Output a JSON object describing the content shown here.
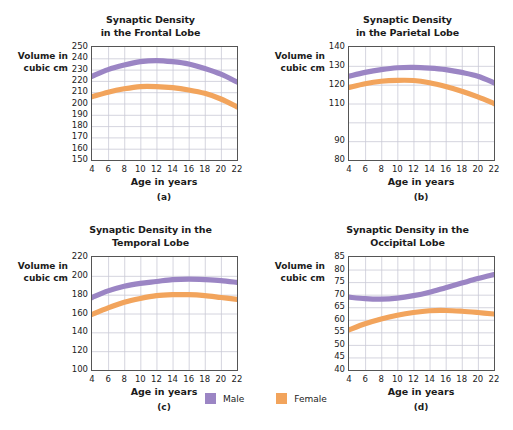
{
  "figure": {
    "caption_letters": [
      "(a)",
      "(b)",
      "(c)",
      "(d)"
    ],
    "shared_xlabel": "Age in years",
    "shared_ylabel": "Volume in\ncubic cm",
    "ylabel_line1": "Volume in",
    "ylabel_line2": "cubic cm"
  },
  "colors": {
    "male": "#9b85c4",
    "female": "#f2a45c",
    "grid": "#c9c9d6",
    "axis": "#555555",
    "text": "#1b1b1b"
  },
  "legend": {
    "position": "bottom-center",
    "items": [
      {
        "label": "Male",
        "color": "#9b85c4",
        "swatch_name": "male-swatch"
      },
      {
        "label": "Female",
        "color": "#f2a45c",
        "swatch_name": "female-swatch"
      }
    ]
  },
  "panels": [
    {
      "letter": "(a)",
      "title_line1": "Synaptic Density",
      "title_line2": "in the Frontal Lobe",
      "title": "Synaptic Density in the Frontal Lobe",
      "yticks": [
        "250",
        "240",
        "230",
        "220",
        "210",
        "200",
        "190",
        "180",
        "170",
        "160",
        "150"
      ],
      "xticks": [
        "4",
        "6",
        "8",
        "10",
        "12",
        "14",
        "16",
        "18",
        "20",
        "22"
      ]
    },
    {
      "letter": "(b)",
      "title_line1": "Synaptic Density",
      "title_line2": "in the Parietal Lobe",
      "title": "Synaptic Density in the Parietal Lobe",
      "yticks": [
        "140",
        "130",
        "120",
        "110",
        "",
        "90",
        "80"
      ],
      "xticks": [
        "4",
        "6",
        "8",
        "10",
        "12",
        "14",
        "16",
        "18",
        "20",
        "22"
      ]
    },
    {
      "letter": "(c)",
      "title_line1": "Synaptic Density in the",
      "title_line2": "Temporal Lobe",
      "title": "Synaptic Density in the Temporal Lobe",
      "yticks": [
        "220",
        "200",
        "180",
        "160",
        "140",
        "120",
        "100"
      ],
      "xticks": [
        "4",
        "6",
        "8",
        "10",
        "12",
        "14",
        "16",
        "18",
        "20",
        "22"
      ]
    },
    {
      "letter": "(d)",
      "title_line1": "Synaptic Density in the",
      "title_line2": "Occipital Lobe",
      "title": "Synaptic Density in the Occipital Lobe",
      "yticks": [
        "85",
        "80",
        "75",
        "70",
        "65",
        "60",
        "55",
        "50",
        "45",
        "40"
      ],
      "xticks": [
        "4",
        "6",
        "8",
        "10",
        "12",
        "14",
        "16",
        "18",
        "20",
        "22"
      ]
    }
  ],
  "chart_data": [
    {
      "type": "line",
      "panel": "(a)",
      "title": "Synaptic Density in the Frontal Lobe",
      "xlabel": "Age in years",
      "ylabel": "Volume in cubic cm",
      "xlim": [
        4,
        22
      ],
      "ylim": [
        150,
        250
      ],
      "yticks": [
        150,
        160,
        170,
        180,
        190,
        200,
        210,
        220,
        230,
        240,
        250
      ],
      "xticks": [
        4,
        6,
        8,
        10,
        12,
        14,
        16,
        18,
        20,
        22
      ],
      "grid": true,
      "x": [
        4,
        6,
        8,
        10,
        12,
        14,
        16,
        18,
        20,
        22
      ],
      "series": [
        {
          "name": "Male",
          "color": "#9b85c4",
          "values": [
            224,
            230,
            234,
            237,
            238,
            237,
            235,
            231,
            226,
            219
          ]
        },
        {
          "name": "Female",
          "color": "#f2a45c",
          "values": [
            206,
            210,
            213,
            215,
            215,
            214,
            212,
            209,
            204,
            197
          ]
        }
      ]
    },
    {
      "type": "line",
      "panel": "(b)",
      "title": "Synaptic Density in the Parietal Lobe",
      "xlabel": "Age in years",
      "ylabel": "Volume in cubic cm",
      "xlim": [
        4,
        22
      ],
      "ylim": [
        80,
        140
      ],
      "yticks": [
        80,
        90,
        100,
        110,
        120,
        130,
        140
      ],
      "xticks": [
        4,
        6,
        8,
        10,
        12,
        14,
        16,
        18,
        20,
        22
      ],
      "grid": true,
      "x": [
        4,
        6,
        8,
        10,
        12,
        14,
        16,
        18,
        20,
        22
      ],
      "series": [
        {
          "name": "Male",
          "color": "#9b85c4",
          "values": [
            124.5,
            126.5,
            128,
            129,
            129.2,
            128.8,
            128,
            126.5,
            124.5,
            121
          ]
        },
        {
          "name": "Female",
          "color": "#f2a45c",
          "values": [
            118.5,
            120.5,
            121.8,
            122.3,
            122.2,
            121,
            119,
            116.5,
            113.5,
            110
          ]
        }
      ]
    },
    {
      "type": "line",
      "panel": "(c)",
      "title": "Synaptic Density in the Temporal Lobe",
      "xlabel": "Age in years",
      "ylabel": "Volume in cubic cm",
      "xlim": [
        4,
        22
      ],
      "ylim": [
        100,
        220
      ],
      "yticks": [
        100,
        120,
        140,
        160,
        180,
        200,
        220
      ],
      "xticks": [
        4,
        6,
        8,
        10,
        12,
        14,
        16,
        18,
        20,
        22
      ],
      "grid": true,
      "x": [
        4,
        6,
        8,
        10,
        12,
        14,
        16,
        18,
        20,
        22
      ],
      "series": [
        {
          "name": "Male",
          "color": "#9b85c4",
          "values": [
            177,
            184,
            189,
            192,
            194,
            196,
            196.5,
            196,
            195,
            193
          ]
        },
        {
          "name": "Female",
          "color": "#f2a45c",
          "values": [
            159,
            166,
            172,
            176,
            179,
            180,
            180,
            179,
            177,
            175
          ]
        }
      ]
    },
    {
      "type": "line",
      "panel": "(d)",
      "title": "Synaptic Density in the Occipital Lobe",
      "xlabel": "Age in years",
      "ylabel": "Volume in cubic cm",
      "xlim": [
        4,
        22
      ],
      "ylim": [
        40,
        85
      ],
      "yticks": [
        40,
        45,
        50,
        55,
        60,
        65,
        70,
        75,
        80,
        85
      ],
      "xticks": [
        4,
        6,
        8,
        10,
        12,
        14,
        16,
        18,
        20,
        22
      ],
      "grid": true,
      "x": [
        4,
        6,
        8,
        10,
        12,
        14,
        16,
        18,
        20,
        22
      ],
      "series": [
        {
          "name": "Male",
          "color": "#9b85c4",
          "values": [
            69,
            68.4,
            68.2,
            68.6,
            69.6,
            71,
            72.8,
            74.6,
            76.4,
            78
          ]
        },
        {
          "name": "Female",
          "color": "#f2a45c",
          "values": [
            56,
            58.4,
            60.3,
            61.8,
            62.9,
            63.6,
            63.7,
            63.4,
            62.9,
            62.3
          ]
        }
      ]
    }
  ]
}
